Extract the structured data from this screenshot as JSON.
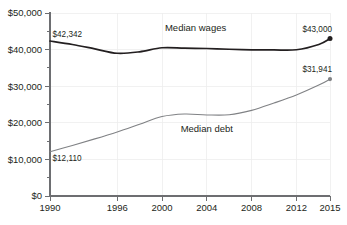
{
  "chart_data": {
    "type": "line",
    "title": "",
    "xlabel": "",
    "ylabel": "",
    "xlim": [
      1990,
      2015
    ],
    "ylim": [
      0,
      50000
    ],
    "grid": true,
    "legend_position": "inline-annotations",
    "x_ticks": [
      "1990",
      "1996",
      "2000",
      "2004",
      "2008",
      "2012",
      "2015"
    ],
    "x_tick_values": [
      1990,
      1996,
      2000,
      2004,
      2008,
      2012,
      2015
    ],
    "y_ticks": [
      "$0",
      "$10,000",
      "$20,000",
      "$30,000",
      "$40,000",
      "$50,000"
    ],
    "y_tick_values": [
      0,
      10000,
      20000,
      30000,
      40000,
      50000
    ],
    "y_minor_tick_values": [
      5000,
      15000,
      25000,
      35000,
      45000
    ],
    "series": [
      {
        "name": "Median wages",
        "color": "#231f20",
        "label_text": "Median wages",
        "label_x": 2003,
        "label_y": 45200,
        "start_label": "$42,342",
        "end_label": "$43,000",
        "end_marker": true,
        "x": [
          1990,
          1992,
          1994,
          1996,
          1998,
          2000,
          2002,
          2004,
          2006,
          2008,
          2010,
          2012,
          2014,
          2015
        ],
        "values": [
          42342,
          41400,
          40200,
          39000,
          39400,
          40500,
          40400,
          40300,
          40100,
          39950,
          39900,
          39950,
          41400,
          43000
        ]
      },
      {
        "name": "Median debt",
        "color": "#808285",
        "label_text": "Median debt",
        "label_x": 2004,
        "label_y": 17600,
        "start_label": "$12,110",
        "end_label": "$31,941",
        "end_marker": true,
        "x": [
          1990,
          1992,
          1994,
          1996,
          1998,
          2000,
          2002,
          2004,
          2006,
          2008,
          2010,
          2012,
          2014,
          2015
        ],
        "values": [
          12110,
          13800,
          15600,
          17500,
          19600,
          21700,
          22400,
          22150,
          22200,
          23400,
          25400,
          27600,
          30300,
          31941
        ]
      }
    ]
  }
}
